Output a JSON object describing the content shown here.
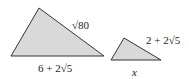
{
  "figure": {
    "fill_color": "#d9d9d9",
    "stroke_color": "#333333",
    "large_triangle": {
      "side_label": "√80",
      "base_label": "6 + 2√5"
    },
    "small_triangle": {
      "side_label": "2 + 2√5",
      "base_label": "x"
    }
  }
}
